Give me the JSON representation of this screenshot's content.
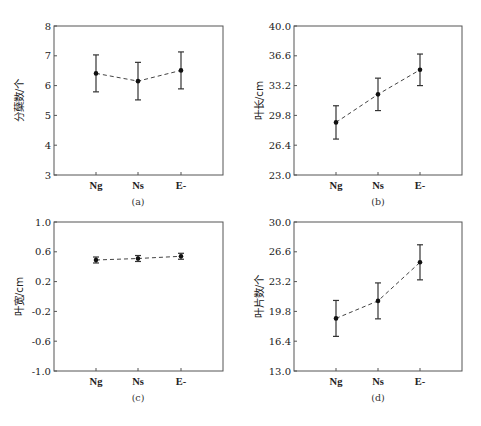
{
  "chart_data": [
    {
      "type": "line",
      "panel": "a",
      "caption": "(a)",
      "title": "",
      "xlabel": "",
      "ylabel": "分蘖数/个",
      "categories": [
        "Ng",
        "Ns",
        "E-"
      ],
      "ylim": [
        3,
        8
      ],
      "yticks": [
        3,
        4,
        5,
        6,
        7,
        8
      ],
      "ytick_labels": [
        "3",
        "4",
        "5",
        "6",
        "7",
        "8"
      ],
      "series": [
        {
          "name": "分蘖数",
          "values": [
            6.41,
            6.15,
            6.51
          ],
          "error": [
            0.62,
            0.63,
            0.62
          ],
          "style": "dashed",
          "marker": "circle"
        }
      ],
      "grid": false,
      "legend": null
    },
    {
      "type": "line",
      "panel": "b",
      "caption": "(b)",
      "title": "",
      "xlabel": "",
      "ylabel": "叶长/cm",
      "categories": [
        "Ng",
        "Ns",
        "E-"
      ],
      "ylim": [
        23.0,
        40.0
      ],
      "yticks": [
        23.0,
        26.4,
        29.8,
        33.2,
        36.6,
        40.0
      ],
      "ytick_labels": [
        "23.0",
        "26.4",
        "29.8",
        "33.2",
        "36.6",
        "40.0"
      ],
      "series": [
        {
          "name": "叶长",
          "values": [
            29.0,
            32.2,
            35.0
          ],
          "error": [
            1.9,
            1.85,
            1.8
          ],
          "style": "dashed",
          "marker": "circle"
        }
      ],
      "grid": false,
      "legend": null
    },
    {
      "type": "line",
      "panel": "c",
      "caption": "(c)",
      "title": "",
      "xlabel": "",
      "ylabel": "叶宽/cm",
      "categories": [
        "Ng",
        "Ns",
        "E-"
      ],
      "ylim": [
        -1.0,
        1.0
      ],
      "yticks": [
        -1.0,
        -0.6,
        -0.2,
        0.2,
        0.6,
        1.0
      ],
      "ytick_labels": [
        "-1.0",
        "-0.6",
        "-0.2",
        "0.2",
        "0.6",
        "1.0"
      ],
      "series": [
        {
          "name": "叶宽",
          "values": [
            0.49,
            0.51,
            0.54
          ],
          "error": [
            0.04,
            0.04,
            0.04
          ],
          "style": "dashed",
          "marker": "circle"
        }
      ],
      "grid": false,
      "legend": null
    },
    {
      "type": "line",
      "panel": "d",
      "caption": "(d)",
      "title": "",
      "xlabel": "",
      "ylabel": "叶片数/个",
      "categories": [
        "Ng",
        "Ns",
        "E-"
      ],
      "ylim": [
        13.0,
        30.0
      ],
      "yticks": [
        13.0,
        16.4,
        19.8,
        23.2,
        26.6,
        30.0
      ],
      "ytick_labels": [
        "13.0",
        "16.4",
        "19.8",
        "23.2",
        "26.6",
        "30.0"
      ],
      "series": [
        {
          "name": "叶片数",
          "values": [
            19.0,
            21.0,
            25.4
          ],
          "error": [
            2.05,
            2.05,
            2.0
          ],
          "style": "dashed",
          "marker": "circle"
        }
      ],
      "grid": false,
      "legend": null
    }
  ],
  "layout": {
    "panels": [
      {
        "left": 54,
        "top": 26,
        "right": 223,
        "bottom": 175,
        "xticks": [
          96,
          138,
          181
        ]
      },
      {
        "left": 294,
        "top": 26,
        "right": 462,
        "bottom": 175,
        "xticks": [
          336,
          378,
          420
        ]
      },
      {
        "left": 54,
        "top": 222,
        "right": 223,
        "bottom": 371,
        "xticks": [
          96,
          138,
          181
        ]
      },
      {
        "left": 294,
        "top": 222,
        "right": 462,
        "bottom": 371,
        "xticks": [
          336,
          378,
          420
        ]
      }
    ],
    "colors": {
      "frame": "#555555",
      "line": "#444444",
      "marker": "#111111",
      "text": "#222222"
    }
  }
}
